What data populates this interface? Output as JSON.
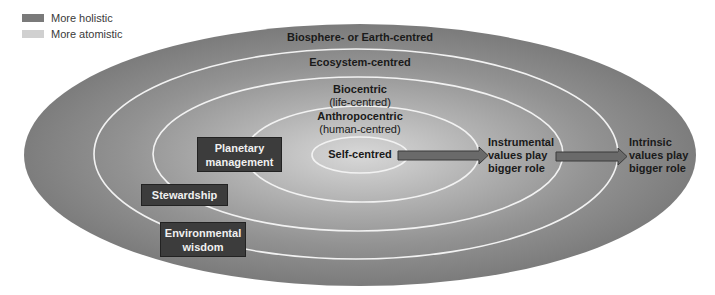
{
  "legend": {
    "items": [
      {
        "label": "More holistic",
        "color": "#7a7a7a"
      },
      {
        "label": "More atomistic",
        "color": "#d0d0d0"
      }
    ]
  },
  "rings": [
    {
      "id": "biosphere",
      "title": "Biosphere- or Earth-centred",
      "subtitle": ""
    },
    {
      "id": "ecosystem",
      "title": "Ecosystem-centred",
      "subtitle": ""
    },
    {
      "id": "biocentric",
      "title": "Biocentric",
      "subtitle": "(life-centred)"
    },
    {
      "id": "anthropocentric",
      "title": "Anthropocentric",
      "subtitle": "(human-centred)"
    },
    {
      "id": "self",
      "title": "Self-centred",
      "subtitle": ""
    }
  ],
  "boxes": [
    {
      "label": "Planetary\nmanagement"
    },
    {
      "label": "Stewardship"
    },
    {
      "label": "Environmental\nwisdom"
    }
  ],
  "annotations": {
    "instrumental": "Instrumental\nvalues play\nbigger role",
    "intrinsic": "Intrinsic\nvalues play\nbigger role"
  },
  "colors": {
    "outer": "#808080",
    "inner": "#d4d4d4",
    "ring_line": "#f2f2f2",
    "box_fill": "#3c3c3c",
    "arrow_fill": "#6a6a6a"
  }
}
